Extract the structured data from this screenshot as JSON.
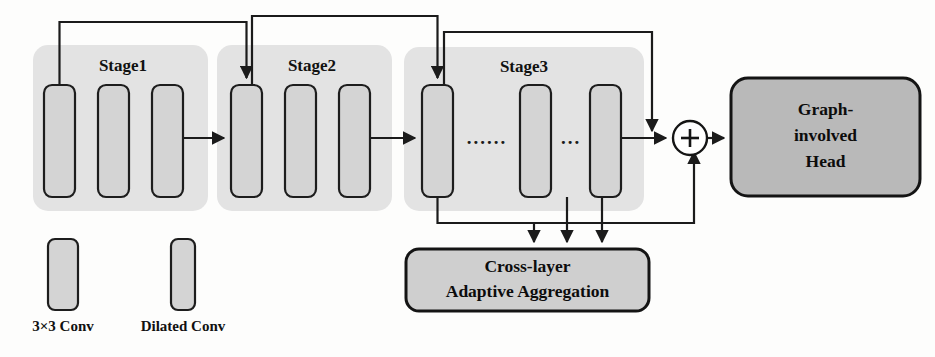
{
  "diagram": {
    "background_color": "#fdfdfc",
    "stage_fill": "#e3e3e3",
    "conv_fill": "#d4d4d4",
    "head_fill": "#b9b9b9",
    "agg_fill": "#cfcfcf",
    "line_color": "#1b1b1b"
  },
  "stages": [
    {
      "id": "stage1",
      "label": "Stage1",
      "label_x": 123,
      "label_y": 67,
      "container": {
        "x": 33,
        "y": 45,
        "w": 175,
        "h": 166
      },
      "blocks": [
        {
          "id": "s1b1",
          "type": "3x3 Conv",
          "x": 44,
          "y": 85,
          "w": 31,
          "h": 112
        },
        {
          "id": "s1b2",
          "type": "3x3 Conv",
          "x": 98,
          "y": 85,
          "w": 31,
          "h": 112
        },
        {
          "id": "s1b3",
          "type": "3x3 Conv",
          "x": 152,
          "y": 85,
          "w": 31,
          "h": 112
        }
      ]
    },
    {
      "id": "stage2",
      "label": "Stage2",
      "label_x": 312,
      "label_y": 67,
      "container": {
        "x": 217,
        "y": 45,
        "w": 175,
        "h": 166
      },
      "blocks": [
        {
          "id": "s2b1",
          "type": "3x3 Conv",
          "x": 231,
          "y": 85,
          "w": 31,
          "h": 112
        },
        {
          "id": "s2b2",
          "type": "3x3 Conv",
          "x": 285,
          "y": 85,
          "w": 31,
          "h": 112
        },
        {
          "id": "s2b3",
          "type": "3x3 Conv",
          "x": 339,
          "y": 85,
          "w": 31,
          "h": 112
        }
      ]
    },
    {
      "id": "stage3",
      "label": "Stage3",
      "label_x": 524,
      "label_y": 68,
      "container": {
        "x": 404,
        "y": 47,
        "w": 240,
        "h": 164
      },
      "blocks": [
        {
          "id": "s3b1",
          "type": "Dilated Conv",
          "x": 422,
          "y": 85,
          "w": 31,
          "h": 112
        },
        {
          "id": "s3b2",
          "type": "Dilated Conv",
          "x": 520,
          "y": 85,
          "w": 31,
          "h": 112
        },
        {
          "id": "s3b3",
          "type": "Dilated Conv",
          "x": 590,
          "y": 85,
          "w": 31,
          "h": 112
        }
      ],
      "ellipses": [
        {
          "id": "dots-long",
          "text": "......",
          "x": 487,
          "y": 140
        },
        {
          "id": "dots-short",
          "text": "...",
          "x": 571,
          "y": 140
        }
      ]
    }
  ],
  "nodes": {
    "sum": {
      "id": "sum-node",
      "symbol": "+",
      "cx": 690,
      "cy": 138,
      "r": 17
    },
    "head": {
      "id": "graph-involved-head",
      "lines": [
        "Graph-",
        "involved",
        "Head"
      ],
      "x": 731,
      "y": 78,
      "w": 189,
      "h": 118
    },
    "aggregation": {
      "id": "cross-layer-adaptive-aggregation",
      "lines": [
        "Cross-layer",
        "Adaptive Aggregation"
      ],
      "x": 406,
      "y": 249,
      "w": 243,
      "h": 62
    }
  },
  "legend": {
    "items": [
      {
        "id": "legend-3x3-conv",
        "label": "3×3 Conv",
        "box": {
          "x": 48,
          "y": 239,
          "w": 30,
          "h": 71
        },
        "label_x": 63,
        "label_y": 328
      },
      {
        "id": "legend-dilated-conv",
        "label": "Dilated Conv",
        "box": {
          "x": 171,
          "y": 239,
          "w": 24,
          "h": 71
        },
        "label_x": 183,
        "label_y": 328
      }
    ]
  },
  "connections": [
    {
      "id": "skip-stage1-to-stage2",
      "kind": "skip",
      "d": "M 59.5 85 L 59.5 22 L 246.5 22 L 246.5 78",
      "arrow": "down",
      "ax": 246.5,
      "ay": 85
    },
    {
      "id": "skip-stage2-to-stage3",
      "kind": "skip",
      "d": "M 252 85 L 252 16 L 437.5 16 L 437.5 78",
      "arrow": "down",
      "ax": 437.5,
      "ay": 85
    },
    {
      "id": "skip-stage3-to-sum",
      "kind": "skip",
      "d": "M 444 85 L 444 32 L 652 32 L 652 131",
      "arrow": "down",
      "ax": 652,
      "ay": 138
    },
    {
      "id": "flow-stage1-to-stage2",
      "kind": "forward",
      "d": "M 183 138 L 224 138",
      "arrow": "right",
      "ax": 231,
      "ay": 138
    },
    {
      "id": "flow-stage2-to-stage3",
      "kind": "forward",
      "d": "M 370 138 L 415 138",
      "arrow": "right",
      "ax": 422,
      "ay": 138
    },
    {
      "id": "flow-stage3-to-sum",
      "kind": "forward",
      "d": "M 621 138 L 666 138",
      "arrow": "right",
      "ax": 673,
      "ay": 138
    },
    {
      "id": "flow-sum-to-head",
      "kind": "forward",
      "d": "M 707 138 L 724 138",
      "arrow": "right",
      "ax": 731,
      "ay": 138
    },
    {
      "id": "agg-feed-block1",
      "kind": "aggregate",
      "d": "M 437.5 197 L 437.5 223 L 534 223 L 534 242",
      "arrow": "down",
      "ax": 534,
      "ay": 249
    },
    {
      "id": "agg-feed-mid",
      "kind": "aggregate",
      "d": "M 567 197 L 567 242",
      "arrow": "down",
      "ax": 567,
      "ay": 249
    },
    {
      "id": "agg-feed-block3",
      "kind": "aggregate",
      "d": "M 602 197 L 602 242",
      "arrow": "down",
      "ax": 602,
      "ay": 249
    },
    {
      "id": "agg-out-to-sum",
      "kind": "residual",
      "d": "M 437.5 223 L 694 223 L 694 152",
      "arrow": "up",
      "ax": 694,
      "ay": 145
    }
  ]
}
